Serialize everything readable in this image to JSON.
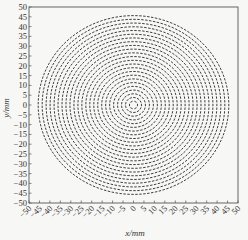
{
  "chart_data": {
    "type": "scatter",
    "subtype": "vector-field",
    "title": "",
    "xlabel": "x/mm",
    "ylabel": "y/mm",
    "xlim": [
      -50,
      50
    ],
    "ylim": [
      -50,
      50
    ],
    "xticks": [
      -50,
      -45,
      -40,
      -35,
      -30,
      -25,
      -20,
      -15,
      -10,
      -5,
      0,
      5,
      10,
      15,
      20,
      25,
      30,
      35,
      40,
      45,
      50
    ],
    "yticks": [
      50,
      45,
      40,
      35,
      30,
      25,
      20,
      15,
      10,
      5,
      0,
      -5,
      -10,
      -15,
      -20,
      -25,
      -30,
      -35,
      -40,
      -45,
      -50
    ],
    "grid": false,
    "legend": null,
    "field": {
      "center": [
        0,
        0
      ],
      "max_radius": 46,
      "ring_spacing": 1.9,
      "dash_spacing": 1.9,
      "dash_length": 1.2,
      "orientation": "tangential"
    },
    "colors": {
      "dash": "#2a2a2a",
      "axis": "#555555",
      "background": "#f7f7f5"
    }
  }
}
